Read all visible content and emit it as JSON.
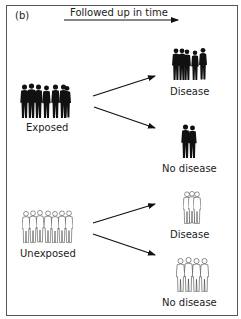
{
  "figure": {
    "panel_label": "(b)",
    "timeline_label": "Followed up in time",
    "colors": {
      "frame": "#555555",
      "ink": "#111111",
      "background": "#ffffff"
    },
    "groups": [
      {
        "id": "exposed",
        "label": "Exposed",
        "style": "filled-silhouettes",
        "people": 6
      },
      {
        "id": "unexposed",
        "label": "Unexposed",
        "style": "outline-silhouettes",
        "people": 7
      }
    ],
    "outcomes": [
      {
        "from": "exposed",
        "label": "Disease",
        "style": "filled-silhouettes",
        "people": 5
      },
      {
        "from": "exposed",
        "label": "No disease",
        "style": "filled-silhouettes",
        "people": 2
      },
      {
        "from": "unexposed",
        "label": "Disease",
        "style": "outline-silhouettes",
        "people": 3
      },
      {
        "from": "unexposed",
        "label": "No disease",
        "style": "outline-silhouettes",
        "people": 4
      }
    ]
  }
}
